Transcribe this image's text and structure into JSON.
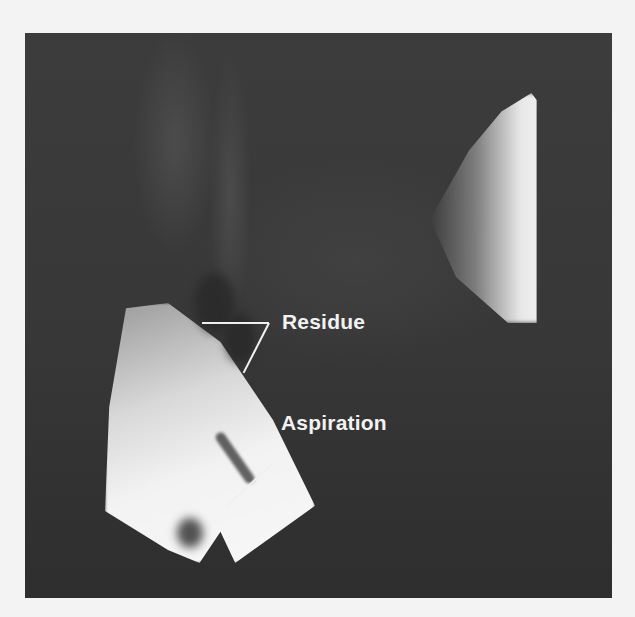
{
  "image": {
    "type": "fluoroscopy-still",
    "palette": {
      "paper": "#f3f3f3",
      "field": "#3a3a3a",
      "bright": "#f4f4f4",
      "annotation": "#f2f2f2"
    }
  },
  "annotations": [
    {
      "label": "Residue",
      "leader_lines": 2
    },
    {
      "label": "Aspiration",
      "leader_lines": 1
    }
  ]
}
